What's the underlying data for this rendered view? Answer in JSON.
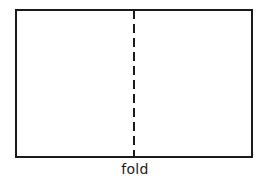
{
  "diagram": {
    "fold_label": "fold",
    "shape": "rectangle",
    "fold_line_style": "dashed",
    "stroke_color": "#1a1a1a",
    "background_color": "#ffffff"
  }
}
